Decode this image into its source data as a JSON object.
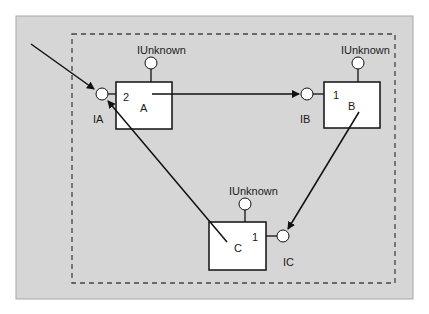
{
  "diagram": {
    "colors": {
      "panel": "#d6d6d6",
      "panel_border": "#a8a8a8",
      "stroke": "#111111",
      "box_fill": "#ffffff"
    },
    "components": [
      {
        "id": "A",
        "label": "A",
        "port_number": "2",
        "interface": "IA",
        "iunknown": "IUnknown"
      },
      {
        "id": "B",
        "label": "B",
        "port_number": "1",
        "interface": "IB",
        "iunknown": "IUnknown"
      },
      {
        "id": "C",
        "label": "C",
        "port_number": "1",
        "interface": "IC",
        "iunknown": "IUnknown"
      }
    ],
    "connections": [
      {
        "from": "external",
        "to": "IA"
      },
      {
        "from": "A",
        "to": "IB"
      },
      {
        "from": "B",
        "to": "IC"
      },
      {
        "from": "C",
        "to": "IA"
      }
    ]
  }
}
